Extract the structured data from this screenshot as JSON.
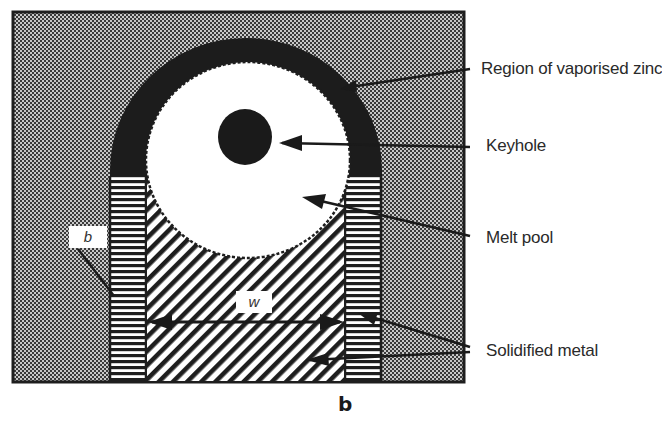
{
  "figure": {
    "caption": "b",
    "dimension_labels": {
      "b": "b",
      "w": "w"
    },
    "callouts": [
      {
        "id": "vaporised-zinc",
        "label": "Region of vaporised zinc"
      },
      {
        "id": "keyhole",
        "label": "Keyhole"
      },
      {
        "id": "melt-pool",
        "label": "Melt pool"
      },
      {
        "id": "solidified-metal",
        "label": "Solidified metal"
      }
    ],
    "colors": {
      "background_dots": "#8a8a8a",
      "frame": "#1e1e1e",
      "vapour_band": "#1c1c1c",
      "melt_pool": "#ffffff",
      "keyhole": "#1a1a1a",
      "hatch": "#1e1e1e"
    }
  }
}
